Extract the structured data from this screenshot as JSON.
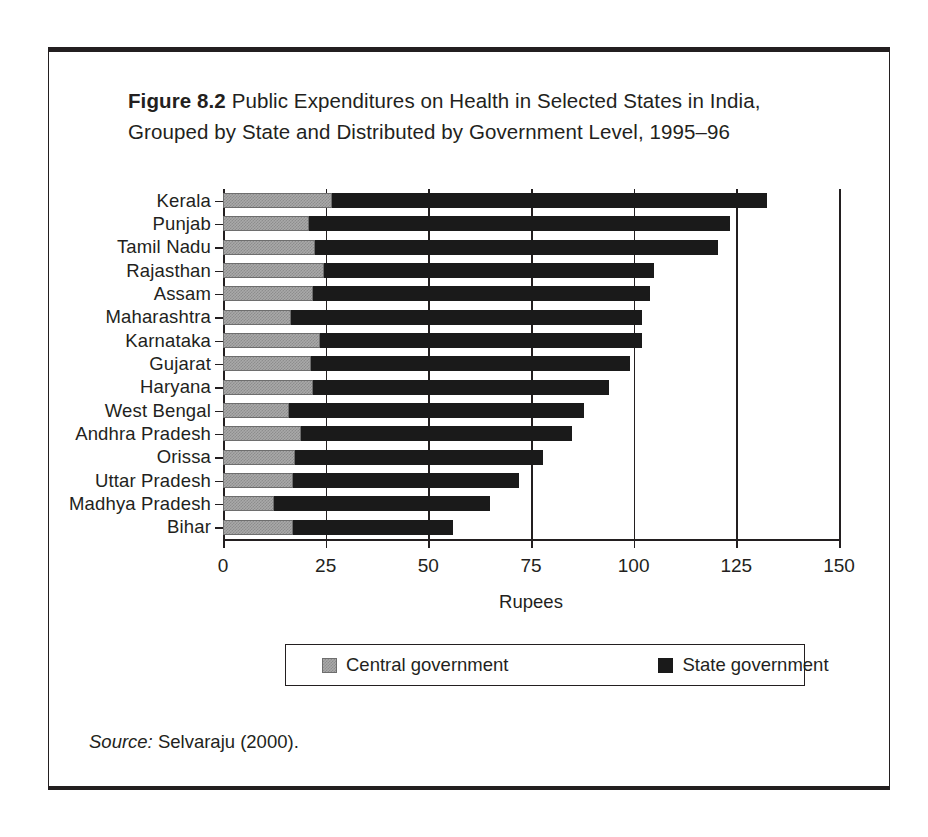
{
  "figure": {
    "number_label": "Figure 8.2",
    "caption_text": " Public Expenditures on Health in Selected States in India, Grouped by State and Distributed by Government Level, 1995–96",
    "source_label": "Source:",
    "source_text": " Selvaraju (2000)."
  },
  "legend": {
    "position": "bottom",
    "items": [
      {
        "label": "Central government",
        "color": "#a9a9a9"
      },
      {
        "label": "State government",
        "color": "#1a1a1a"
      }
    ]
  },
  "chart_data": {
    "type": "bar",
    "orientation": "horizontal",
    "stacked": true,
    "title": "Public Expenditures on Health in Selected States in India, Grouped by State and Distributed by Government Level, 1995–96",
    "xlabel": "Rupees",
    "ylabel": "",
    "xlim": [
      0,
      150
    ],
    "xticks": [
      0,
      25,
      50,
      75,
      100,
      125,
      150
    ],
    "xticklabels": [
      "0",
      "25",
      "50",
      "75",
      "100",
      "125",
      "150"
    ],
    "grid": "vertical",
    "legend_position": "bottom",
    "categories": [
      "Kerala",
      "Punjab",
      "Tamil Nadu",
      "Rajasthan",
      "Assam",
      "Maharashtra",
      "Karnataka",
      "Gujarat",
      "Haryana",
      "West Bengal",
      "Andhra Pradesh",
      "Orissa",
      "Uttar Pradesh",
      "Madhya Pradesh",
      "Bihar"
    ],
    "series": [
      {
        "name": "Central government",
        "color": "#a9a9a9",
        "values": [
          26.5,
          21.0,
          22.5,
          24.5,
          22.0,
          16.5,
          23.5,
          21.5,
          22.0,
          16.0,
          19.0,
          17.5,
          17.0,
          12.5,
          17.0
        ]
      },
      {
        "name": "State government",
        "color": "#1a1a1a",
        "values": [
          106.0,
          102.5,
          98.0,
          80.5,
          82.0,
          85.5,
          78.5,
          77.5,
          72.0,
          72.0,
          66.0,
          60.5,
          55.0,
          52.5,
          39.0
        ]
      }
    ],
    "totals": [
      132.5,
      123.5,
      120.5,
      105.0,
      104.0,
      102.0,
      102.0,
      99.0,
      94.0,
      88.0,
      85.0,
      78.0,
      72.0,
      65.0,
      56.0
    ]
  }
}
